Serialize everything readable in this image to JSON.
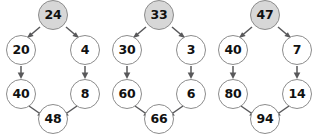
{
  "diagram": {
    "node_fill_shaded": "#d7d7d7",
    "node_fill_plain": "#ffffff",
    "node_stroke": "#8c8c8c",
    "edge_color": "#58585a",
    "groups": [
      {
        "id": "group-1",
        "top": "24",
        "left1": "20",
        "right1": "4",
        "left2": "40",
        "right2": "8",
        "bottom": "48"
      },
      {
        "id": "group-2",
        "top": "33",
        "left1": "30",
        "right1": "3",
        "left2": "60",
        "right2": "6",
        "bottom": "66"
      },
      {
        "id": "group-3",
        "top": "47",
        "left1": "40",
        "right1": "7",
        "left2": "80",
        "right2": "14",
        "bottom": "94"
      }
    ]
  }
}
